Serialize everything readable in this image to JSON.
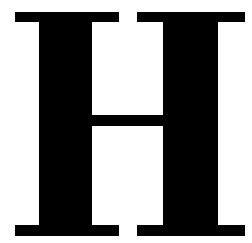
{
  "glyph": {
    "character": "H",
    "color": "#000000",
    "background": "#ffffff"
  }
}
